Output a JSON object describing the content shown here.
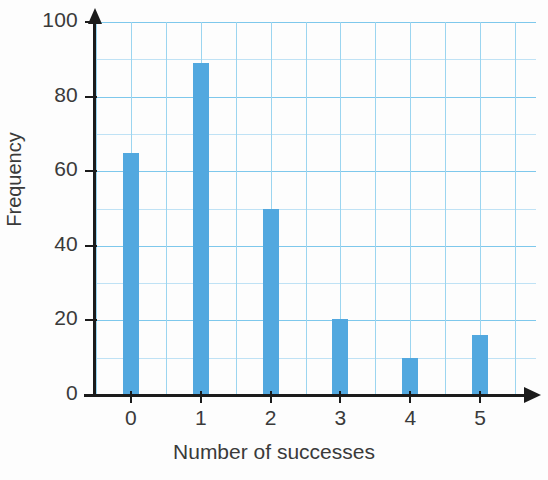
{
  "chart_data": {
    "type": "bar",
    "title": "",
    "xlabel": "Number of successes",
    "ylabel": "Frequency",
    "categories": [
      "0",
      "1",
      "2",
      "3",
      "4",
      "5"
    ],
    "values": [
      65,
      89,
      50,
      20.5,
      10,
      16
    ],
    "xlim": [
      -0.5,
      5.8
    ],
    "ylim": [
      0,
      100
    ],
    "ytick_labels": [
      "0",
      "20",
      "40",
      "60",
      "80",
      "100"
    ],
    "ytick_values": [
      0,
      20,
      40,
      60,
      80,
      100
    ],
    "y_minor_step": 10,
    "grid": true,
    "legend": null,
    "bar_color": "#52a8df",
    "grid_major_color": "#7ec8ec",
    "grid_minor_color": "#bfe2f5",
    "axis_color": "#1b1b1b",
    "text_color": "#3a3a3a"
  },
  "axes": {
    "y_title": "Frequency",
    "x_title": "Number of successes",
    "y_ticks": [
      {
        "label": "100",
        "value": 100
      },
      {
        "label": "80",
        "value": 80
      },
      {
        "label": "60",
        "value": 60
      },
      {
        "label": "40",
        "value": 40
      },
      {
        "label": "20",
        "value": 20
      },
      {
        "label": "0",
        "value": 0
      }
    ],
    "x_ticks": [
      {
        "label": "0",
        "value": 0
      },
      {
        "label": "1",
        "value": 1
      },
      {
        "label": "2",
        "value": 2
      },
      {
        "label": "3",
        "value": 3
      },
      {
        "label": "4",
        "value": 4
      },
      {
        "label": "5",
        "value": 5
      }
    ]
  }
}
